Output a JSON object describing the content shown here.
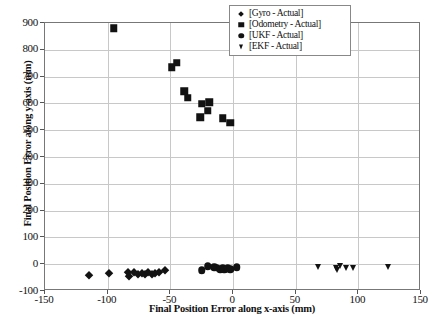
{
  "chart_data": {
    "type": "scatter",
    "title": "",
    "xlabel": "Final Position Error along x-axis (mm)",
    "ylabel": "Final Position Error along y-axis (mm)",
    "xlim": [
      -150,
      150
    ],
    "ylim": [
      -100,
      900
    ],
    "xticks": [
      -150,
      -100,
      -50,
      0,
      50,
      100,
      150
    ],
    "yticks": [
      -100,
      0,
      100,
      200,
      300,
      400,
      500,
      600,
      700,
      800,
      900
    ],
    "xtick_labels": [
      "-150",
      "-100",
      "-50",
      "0",
      "50",
      "100",
      "150"
    ],
    "ytick_labels": [
      "-100",
      "0",
      "100",
      "200",
      "300",
      "400",
      "500",
      "600",
      "700",
      "800",
      "900"
    ],
    "grid": true,
    "legend_position": "upper right",
    "series": [
      {
        "name": "[Gyro - Actual]",
        "marker": "diamond",
        "color": "#121212",
        "points": [
          [
            -115,
            -40
          ],
          [
            -99,
            -32
          ],
          [
            -84,
            -28
          ],
          [
            -83,
            -45
          ],
          [
            -79,
            -30
          ],
          [
            -76,
            -38
          ],
          [
            -73,
            -32
          ],
          [
            -70,
            -35
          ],
          [
            -68,
            -30
          ],
          [
            -65,
            -36
          ],
          [
            -62,
            -33
          ],
          [
            -59,
            -30
          ],
          [
            -54,
            -22
          ]
        ]
      },
      {
        "name": "[Odometry - Actual]",
        "marker": "square",
        "color": "#121212",
        "points": [
          [
            -95,
            880
          ],
          [
            -49,
            735
          ],
          [
            -45,
            752
          ],
          [
            -39,
            645
          ],
          [
            -36,
            622
          ],
          [
            -25,
            598
          ],
          [
            -26,
            548
          ],
          [
            -19,
            605
          ],
          [
            -20,
            572
          ],
          [
            -8,
            545
          ],
          [
            -2,
            527
          ]
        ]
      },
      {
        "name": "[UKF - Actual]",
        "marker": "circle",
        "color": "#121212",
        "points": [
          [
            -25,
            -22
          ],
          [
            -20,
            -8
          ],
          [
            -15,
            -12
          ],
          [
            -13,
            -14
          ],
          [
            -10,
            -18
          ],
          [
            -8,
            -16
          ],
          [
            -7,
            -20
          ],
          [
            -5,
            -17
          ],
          [
            -4,
            -14
          ],
          [
            -2,
            -18
          ],
          [
            3,
            -12
          ]
        ]
      },
      {
        "name": "[EKF - Actual]",
        "marker": "triangle-down",
        "color": "#121212",
        "points": [
          [
            68,
            -12
          ],
          [
            82,
            -14
          ],
          [
            83,
            -22
          ],
          [
            85,
            -8
          ],
          [
            90,
            -14
          ],
          [
            96,
            -14
          ],
          [
            124,
            -10
          ]
        ]
      }
    ]
  },
  "legend": {
    "entries": [
      {
        "label": "[Gyro - Actual]",
        "marker": "diamond"
      },
      {
        "label": "[Odometry - Actual]",
        "marker": "square"
      },
      {
        "label": "[UKF - Actual]",
        "marker": "circle"
      },
      {
        "label": "[EKF - Actual]",
        "marker": "triangle-down"
      }
    ]
  },
  "colors": {
    "marker": "#121212",
    "grid": "#c8c8c8",
    "frame": "#777777",
    "background": "#ffffff"
  }
}
